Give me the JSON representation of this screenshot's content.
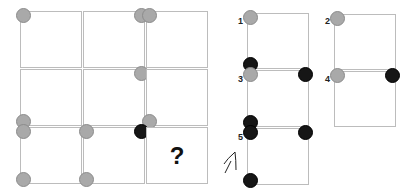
{
  "puzzle": {
    "question_mark": "?",
    "grid": [
      {
        "row": 0,
        "col": 0,
        "dots": [
          {
            "pos": "tl",
            "color": "gray"
          }
        ]
      },
      {
        "row": 0,
        "col": 1,
        "dots": [
          {
            "pos": "tr",
            "color": "gray"
          }
        ]
      },
      {
        "row": 0,
        "col": 2,
        "dots": [
          {
            "pos": "tl",
            "color": "gray"
          }
        ]
      },
      {
        "row": 1,
        "col": 0,
        "dots": [
          {
            "pos": "bl",
            "color": "gray"
          }
        ]
      },
      {
        "row": 1,
        "col": 1,
        "dots": [
          {
            "pos": "tr",
            "color": "gray"
          }
        ]
      },
      {
        "row": 1,
        "col": 2,
        "dots": [
          {
            "pos": "bl",
            "color": "gray"
          }
        ]
      },
      {
        "row": 2,
        "col": 0,
        "dots": [
          {
            "pos": "tl",
            "color": "gray"
          },
          {
            "pos": "bl",
            "color": "gray"
          }
        ]
      },
      {
        "row": 2,
        "col": 1,
        "dots": [
          {
            "pos": "tl",
            "color": "gray"
          },
          {
            "pos": "tr",
            "color": "black"
          },
          {
            "pos": "bl",
            "color": "gray"
          }
        ]
      },
      {
        "row": 2,
        "col": 2,
        "dots": [],
        "question": true
      }
    ]
  },
  "options": [
    {
      "label": "1",
      "dots": [
        {
          "pos": "tl",
          "color": "gray"
        },
        {
          "pos": "bl",
          "color": "black"
        }
      ]
    },
    {
      "label": "2",
      "dots": [
        {
          "pos": "tl",
          "color": "gray"
        }
      ]
    },
    {
      "label": "3",
      "dots": [
        {
          "pos": "tl",
          "color": "gray"
        },
        {
          "pos": "tr",
          "color": "black"
        },
        {
          "pos": "bl",
          "color": "black"
        }
      ]
    },
    {
      "label": "4",
      "dots": [
        {
          "pos": "tl",
          "color": "gray"
        },
        {
          "pos": "tr",
          "color": "black"
        }
      ]
    },
    {
      "label": "5",
      "dots": [
        {
          "pos": "tl",
          "color": "black"
        },
        {
          "pos": "tr",
          "color": "black"
        },
        {
          "pos": "bl",
          "color": "black"
        }
      ]
    }
  ],
  "colors": {
    "gray_dot": "#a9a9a9",
    "black_dot": "#161616",
    "border": "#bcbcbc"
  }
}
